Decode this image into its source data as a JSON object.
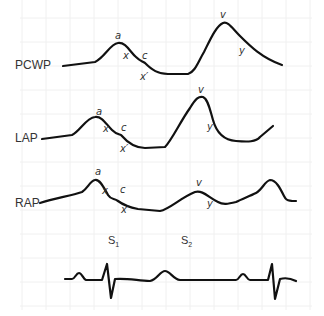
{
  "diagram": {
    "title": "",
    "traces": [
      {
        "label": "PCWP",
        "wave_labels": {
          "a": "a",
          "x": "x",
          "c": "c",
          "x_prime": "x′",
          "v": "v",
          "y": "y"
        }
      },
      {
        "label": "LAP",
        "wave_labels": {
          "a": "a",
          "x": "x",
          "c": "c",
          "x_prime": "x′",
          "v": "v",
          "y": "y"
        }
      },
      {
        "label": "RAP",
        "wave_labels": {
          "a": "a",
          "x": "x",
          "c": "c",
          "x_prime": "x′",
          "v": "v",
          "y": "y"
        }
      }
    ],
    "heart_sounds": [
      {
        "base": "S",
        "sub": "1"
      },
      {
        "base": "S",
        "sub": "2"
      }
    ],
    "ecg": {
      "label": "ECG"
    },
    "colors": {
      "trace": "#111111",
      "grid": "#eeeeee",
      "text": "#333333"
    }
  }
}
